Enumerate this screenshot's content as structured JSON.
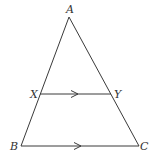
{
  "diagram": {
    "type": "geometry-triangle-parallel",
    "points": {
      "A": {
        "label": "A",
        "x": 69,
        "y": 17,
        "lx": 66,
        "ly": 13
      },
      "X": {
        "label": "X",
        "x": 40,
        "y": 94,
        "lx": 30,
        "ly": 98
      },
      "Y": {
        "label": "Y",
        "x": 111,
        "y": 94,
        "lx": 114,
        "ly": 98
      },
      "B": {
        "label": "B",
        "x": 21,
        "y": 146,
        "lx": 10,
        "ly": 150
      },
      "C": {
        "label": "C",
        "x": 139,
        "y": 146,
        "lx": 140,
        "ly": 150
      }
    },
    "segments": [
      {
        "from": "A",
        "to": "B"
      },
      {
        "from": "A",
        "to": "C"
      },
      {
        "from": "X",
        "to": "Y"
      },
      {
        "from": "B",
        "to": "C"
      }
    ],
    "parallel_marks": [
      {
        "segment": "XY",
        "x": 75,
        "y": 94
      },
      {
        "segment": "BC",
        "x": 78,
        "y": 146
      }
    ],
    "colors": {
      "line": "#3a3a3a",
      "label": "#333333",
      "background": "#ffffff"
    }
  }
}
